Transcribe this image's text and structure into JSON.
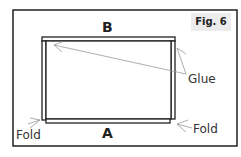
{
  "figure": {
    "label": "Fig. 6"
  },
  "labels": {
    "top": "B",
    "bottom": "A",
    "glue": "Glue",
    "fold_left": "Fold",
    "fold_right": "Fold"
  },
  "colors": {
    "frame": "#222222",
    "lines": "#999999",
    "fig_bg": "#ececec"
  }
}
